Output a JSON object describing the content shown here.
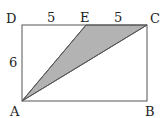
{
  "diagram": {
    "type": "geometry",
    "shape": "rectangle ABCD with shaded triangle AEC",
    "points": {
      "A": {
        "label": "A",
        "x": 22,
        "y": 101
      },
      "B": {
        "label": "B",
        "x": 147,
        "y": 101
      },
      "C": {
        "label": "C",
        "x": 147,
        "y": 25
      },
      "D": {
        "label": "D",
        "x": 22,
        "y": 25
      },
      "E": {
        "label": "E",
        "x": 86,
        "y": 25
      }
    },
    "measures": {
      "DE": "5",
      "EC": "5",
      "AD": "6"
    },
    "shaded_region": "triangle AEC",
    "colors": {
      "line": "#555555",
      "shade": "#b3b3b3"
    }
  }
}
